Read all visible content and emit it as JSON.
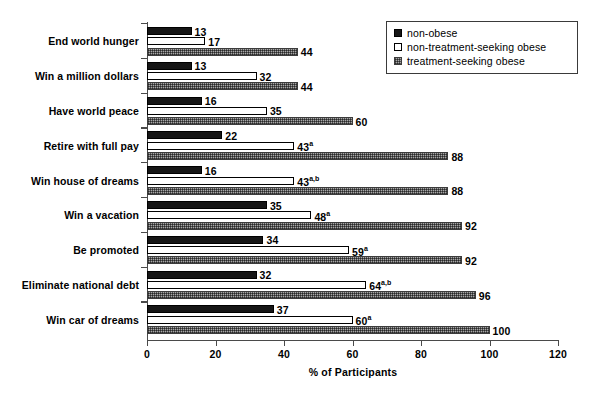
{
  "chart_data": {
    "type": "bar",
    "orientation": "horizontal",
    "title": "",
    "xlabel": "% of Participants",
    "ylabel": "",
    "xlim": [
      0,
      120
    ],
    "xticks": [
      0,
      20,
      40,
      60,
      80,
      100,
      120
    ],
    "grid": false,
    "legend_position": "top-right",
    "categories": [
      "End world hunger",
      "Win a million dollars",
      "Have world peace",
      "Retire with full pay",
      "Win house of dreams",
      "Win a vacation",
      "Be promoted",
      "Eliminate national debt",
      "Win car of dreams"
    ],
    "series": [
      {
        "name": "non-obese",
        "values": [
          13,
          13,
          16,
          22,
          16,
          35,
          34,
          32,
          37
        ],
        "labels": [
          "13",
          "13",
          "16",
          "22",
          "16",
          "35",
          "34",
          "32",
          "37"
        ],
        "superscripts": [
          "",
          "",
          "",
          "",
          "",
          "",
          "",
          "",
          ""
        ]
      },
      {
        "name": "non-treatment-seeking obese",
        "values": [
          17,
          32,
          35,
          43,
          43,
          48,
          59,
          64,
          60
        ],
        "labels": [
          "17",
          "32",
          "35",
          "43",
          "43",
          "48",
          "59",
          "64",
          "60"
        ],
        "superscripts": [
          "",
          "",
          "",
          "a",
          "a,b",
          "a",
          "a",
          "a,b",
          "a"
        ]
      },
      {
        "name": "treatment-seeking obese",
        "values": [
          44,
          44,
          60,
          88,
          88,
          92,
          92,
          96,
          100
        ],
        "labels": [
          "44",
          "44",
          "60",
          "88",
          "88",
          "92",
          "92",
          "96",
          "100"
        ],
        "superscripts": [
          "",
          "",
          "",
          "",
          "",
          "",
          "",
          "",
          ""
        ]
      }
    ]
  },
  "legend": {
    "items": [
      {
        "label": "non-obese",
        "swatch": "solid-black-square"
      },
      {
        "label": "non-treatment-seeking obese",
        "swatch": "hollow-square"
      },
      {
        "label": "treatment-seeking obese",
        "swatch": "gray-hatched-square"
      }
    ]
  },
  "axis": {
    "x_title": "% of Participants",
    "x_tick_labels": [
      "0",
      "20",
      "40",
      "60",
      "80",
      "100",
      "120"
    ]
  }
}
